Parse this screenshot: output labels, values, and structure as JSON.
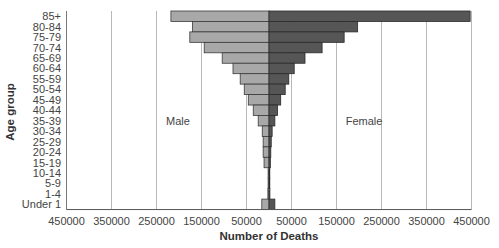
{
  "chart_data": {
    "type": "bar",
    "orientation": "horizontal",
    "subtype": "population-pyramid",
    "title": "",
    "xlabel": "Number of Deaths",
    "ylabel": "Age group",
    "categories": [
      "85+",
      "80-84",
      "75-79",
      "70-74",
      "65-69",
      "60-64",
      "55-59",
      "50-54",
      "45-49",
      "40-44",
      "35-39",
      "30-34",
      "25-29",
      "20-24",
      "15-19",
      "10-14",
      "5-9",
      "1-4",
      "Under 1"
    ],
    "series": [
      {
        "name": "Male",
        "side": "left",
        "color": "#a8a8a8",
        "values": [
          218000,
          170000,
          176000,
          144000,
          104000,
          80000,
          64000,
          55000,
          46000,
          35000,
          24000,
          15000,
          13000,
          13000,
          11000,
          2000,
          2000,
          2500,
          16000
        ]
      },
      {
        "name": "Female",
        "side": "right",
        "color": "#565656",
        "values": [
          447000,
          197000,
          167000,
          118000,
          80000,
          56000,
          44000,
          36000,
          26000,
          19000,
          13000,
          7000,
          5000,
          4000,
          3000,
          1500,
          1500,
          2000,
          13000
        ]
      }
    ],
    "xlim": [
      -450000,
      450000
    ],
    "xticks": [
      -450000,
      -350000,
      -250000,
      -150000,
      -50000,
      50000,
      150000,
      250000,
      350000,
      450000
    ],
    "xtick_labels": [
      "450000",
      "350000",
      "250000",
      "150000",
      "50000",
      "50000",
      "150000",
      "250000",
      "350000",
      "450000"
    ],
    "grid": {
      "vertical": true,
      "horizontal": false,
      "color": "#b8b8b8"
    },
    "annotations": [
      {
        "text": "Male",
        "x": -200000,
        "row": "30-34"
      },
      {
        "text": "Female",
        "x": 210000,
        "row": "30-34"
      }
    ],
    "legend": "none"
  },
  "labels": {
    "male": "Male",
    "female": "Female",
    "xlabel": "Number of Deaths",
    "ylabel": "Age group"
  }
}
